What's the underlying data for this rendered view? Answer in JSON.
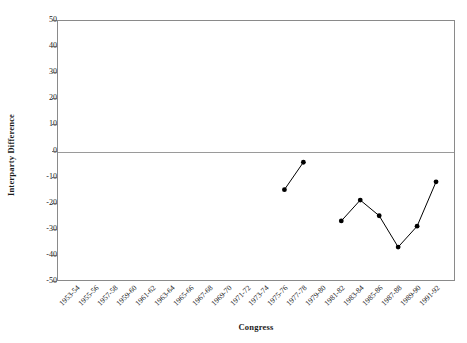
{
  "chart_data": {
    "type": "line",
    "title": "",
    "xlabel": "Congress",
    "ylabel": "Interparty Difference",
    "ylim": [
      -50,
      50
    ],
    "yticks": [
      50,
      40,
      30,
      20,
      10,
      0,
      -10,
      -20,
      -30,
      -40,
      -50
    ],
    "ytick_labels": [
      "50",
      "40",
      "30",
      "20",
      "10",
      "0",
      "-10",
      "-20",
      "-30",
      "-40",
      "-50"
    ],
    "grid": false,
    "legend": null,
    "zero_reference_line": true,
    "marker": "filled-circle",
    "line_color": "#000000",
    "marker_color": "#000000",
    "categories": [
      "1953-54",
      "1955-56",
      "1957-58",
      "1959-60",
      "1961-62",
      "1963-64",
      "1965-66",
      "1967-68",
      "1969-70",
      "1971-72",
      "1973-74",
      "1975-76",
      "1977-78",
      "1979-80",
      "1981-82",
      "1983-84",
      "1985-86",
      "1987-88",
      "1989-90",
      "1991-92"
    ],
    "series": [
      {
        "name": "segment-1",
        "points": [
          {
            "x": "1975-76",
            "y": -15.0
          },
          {
            "x": "1977-78",
            "y": -4.5
          }
        ]
      },
      {
        "name": "segment-2",
        "points": [
          {
            "x": "1981-82",
            "y": -27.0
          },
          {
            "x": "1983-84",
            "y": -19.0
          },
          {
            "x": "1985-86",
            "y": -25.0
          },
          {
            "x": "1987-88",
            "y": -37.0
          },
          {
            "x": "1989-90",
            "y": -29.0
          },
          {
            "x": "1991-92",
            "y": -12.0
          }
        ]
      }
    ]
  },
  "axes": {
    "y_title": "Interparty Difference",
    "x_title": "Congress"
  }
}
